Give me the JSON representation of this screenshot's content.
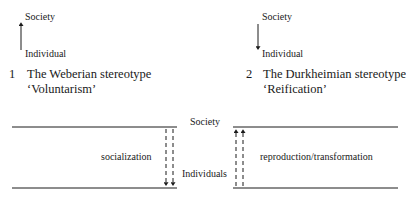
{
  "panel1": {
    "top_label": "Society",
    "bottom_label": "Individual",
    "number": "1",
    "title": "The Weberian stereotype",
    "subtitle": "‘Voluntarism’",
    "arrow_direction": "up"
  },
  "panel2": {
    "top_label": "Society",
    "bottom_label": "Individual",
    "number": "2",
    "title": "The Durkheimian stereotype",
    "subtitle": "‘Reification’",
    "arrow_direction": "down"
  },
  "bottom_diagram": {
    "top_label": "Society",
    "bottom_label": "Individuals",
    "left_label": "socialization",
    "right_label": "reproduction/transformation",
    "left_arrows": "down (dashed, double)",
    "right_arrows": "up (dashed, double)"
  }
}
